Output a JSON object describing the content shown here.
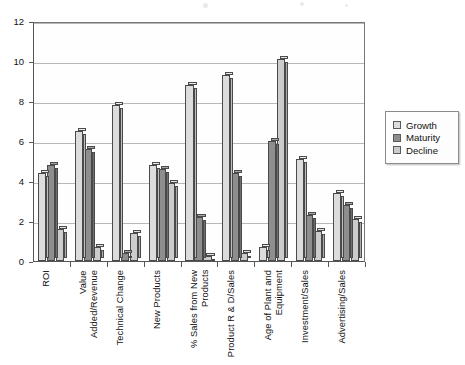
{
  "chart_data": {
    "type": "bar",
    "title": "",
    "subtitle": "",
    "xlabel": "",
    "ylabel": "",
    "ylim": [
      0,
      12
    ],
    "yticks": [
      0,
      2,
      4,
      6,
      8,
      10,
      12
    ],
    "grid": true,
    "legend_position": "right",
    "style": "3d-grouped-bar",
    "categories": [
      "ROI",
      "Value Added/Revenue",
      "Technical Change",
      "New Products",
      "% Sales from New Products",
      "Product R & D/Sales",
      "Age of Plant and Equipment",
      "Investment/Sales",
      "Advertising/Sales"
    ],
    "series": [
      {
        "name": "Growth",
        "color": "#dcdcdc",
        "values": [
          4.4,
          6.5,
          7.8,
          4.8,
          8.8,
          9.3,
          0.7,
          5.1,
          3.4
        ]
      },
      {
        "name": "Maturity",
        "color": "#8e8e8e",
        "values": [
          4.8,
          5.6,
          0.4,
          4.6,
          2.2,
          4.4,
          6.0,
          2.3,
          2.8
        ]
      },
      {
        "name": "Decline",
        "color": "#cccccc",
        "values": [
          1.6,
          0.7,
          1.4,
          3.9,
          0.25,
          0.4,
          10.1,
          1.5,
          2.1
        ]
      }
    ]
  },
  "legend": {
    "items": [
      {
        "label": "Growth",
        "swatch": "#dcdcdc"
      },
      {
        "label": "Maturity",
        "swatch": "#8e8e8e"
      },
      {
        "label": "Decline",
        "swatch": "#cccccc"
      }
    ]
  },
  "axes": {
    "y_tick_labels": [
      "0",
      "2",
      "4",
      "6",
      "8",
      "10",
      "12"
    ]
  }
}
